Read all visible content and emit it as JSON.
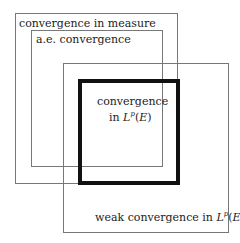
{
  "diagram": {
    "regions": [
      {
        "id": "measure",
        "label": "convergence in measure"
      },
      {
        "id": "ae",
        "label": "a.e. convergence"
      },
      {
        "id": "lp",
        "label_line1": "convergence",
        "label_line2_prefix": "in ",
        "label_math": "L",
        "label_sup": "p",
        "label_suffix": "(E)"
      },
      {
        "id": "weak",
        "label_prefix": "weak convergence in ",
        "label_math": "L",
        "label_sup": "p",
        "label_suffix": "(E)"
      }
    ]
  }
}
